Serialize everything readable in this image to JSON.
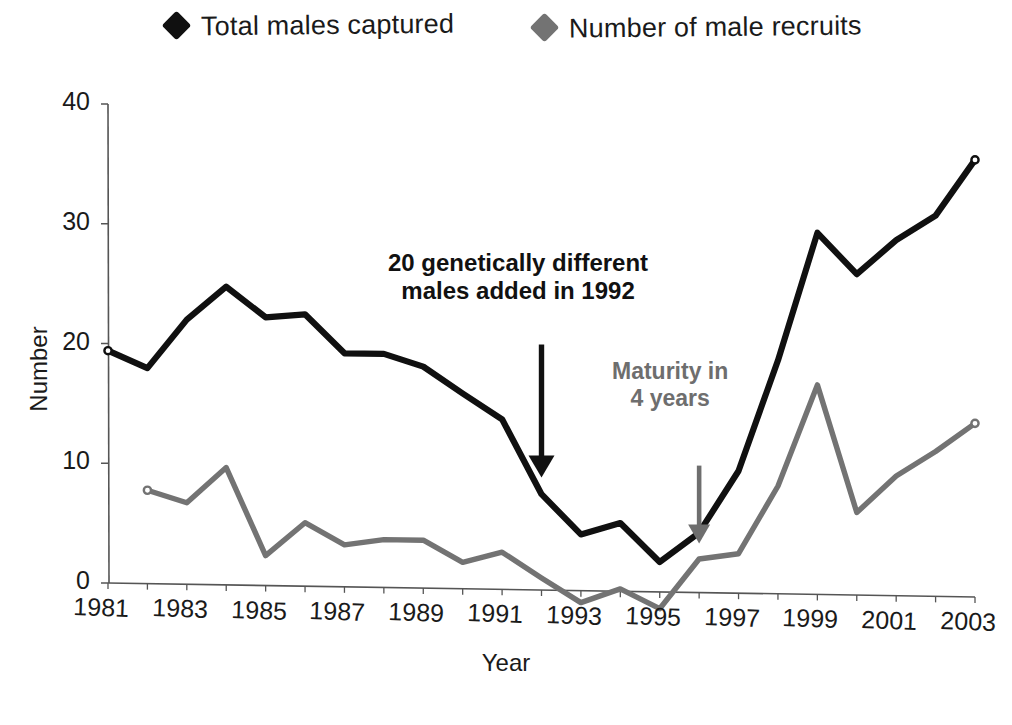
{
  "figure": {
    "background": "#ffffff",
    "series_colors": {
      "total": "#101010",
      "recruits": "#737373"
    }
  },
  "legend": {
    "position": "top",
    "items": [
      {
        "label": "Total males captured",
        "marker": "diamond-marker-black",
        "color": "#101010"
      },
      {
        "label": "Number of male recruits",
        "marker": "diamond-marker-gray",
        "color": "#737373"
      }
    ]
  },
  "annotations": [
    {
      "id": "annotation-added-males",
      "text": "20 genetically different\nmales added in 1992",
      "color": "#111111",
      "arrow": {
        "from_year": 1992,
        "from_value": 20.5,
        "to_year": 1992,
        "to_value": 9.4
      }
    },
    {
      "id": "annotation-maturity",
      "text": "Maturity in\n4 years",
      "color": "#6e6e6e",
      "arrow": {
        "from_year": 1996,
        "from_value": 10.6,
        "to_year": 1996,
        "to_value": 4.1
      }
    }
  ],
  "chart_data": {
    "type": "line",
    "title": "",
    "xlabel": "Year",
    "ylabel": "Number",
    "xlim": [
      1981,
      2003
    ],
    "ylim": [
      0,
      40
    ],
    "yticks": [
      0,
      10,
      20,
      30,
      40
    ],
    "xticks": [
      1981,
      1983,
      1985,
      1987,
      1989,
      1991,
      1993,
      1995,
      1997,
      1999,
      2001,
      2003
    ],
    "grid": false,
    "legend_position": "top",
    "x": [
      1981,
      1982,
      1983,
      1984,
      1985,
      1986,
      1987,
      1988,
      1989,
      1990,
      1991,
      1992,
      1993,
      1994,
      1995,
      1996,
      1997,
      1998,
      1999,
      2000,
      2001,
      2002,
      2003
    ],
    "series": [
      {
        "name": "Total males captured",
        "color": "#101010",
        "values": [
          19.4,
          18.0,
          22.1,
          24.9,
          22.4,
          22.7,
          19.5,
          19.5,
          18.5,
          16.3,
          14.2,
          8.0,
          4.7,
          5.7,
          2.5,
          5.0,
          10.2,
          19.5,
          30.2,
          26.8,
          29.7,
          31.8,
          36.5
        ]
      },
      {
        "name": "Number of male recruits",
        "color": "#737373",
        "values": [
          null,
          7.8,
          6.8,
          9.8,
          2.5,
          5.3,
          3.5,
          4.0,
          4.0,
          2.2,
          3.1,
          1.0,
          -1.0,
          0.2,
          -1.4,
          2.8,
          3.3,
          9.0,
          17.5,
          6.9,
          10.0,
          12.1,
          14.5
        ]
      }
    ]
  }
}
